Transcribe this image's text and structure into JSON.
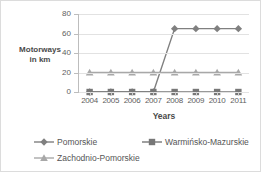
{
  "chart_data": {
    "type": "line",
    "title": "",
    "xlabel": "Years",
    "ylabel": "Motorways in km",
    "ylabel_line1": "Motorways",
    "ylabel_line2": "in km",
    "categories": [
      "2004",
      "2005",
      "2006",
      "2007",
      "2008",
      "2009",
      "2010",
      "2011"
    ],
    "ylim": [
      0,
      80
    ],
    "yticks": [
      0,
      20,
      40,
      60,
      80
    ],
    "grid": true,
    "legend_position": "bottom",
    "series": [
      {
        "name": "Pomorskie",
        "marker": "diamond",
        "color": "#808080",
        "values": [
          0,
          0,
          0,
          0,
          65,
          65,
          65,
          65
        ]
      },
      {
        "name": "Warmińsko-Mazurskie",
        "marker": "square",
        "color": "#777777",
        "values": [
          0,
          0,
          0,
          0,
          0,
          0,
          0,
          0
        ]
      },
      {
        "name": "Zachodnio-Pomorskie",
        "marker": "triangle",
        "color": "#a8a8a8",
        "values": [
          20,
          20,
          20,
          20,
          20,
          20,
          20,
          20
        ]
      }
    ]
  }
}
